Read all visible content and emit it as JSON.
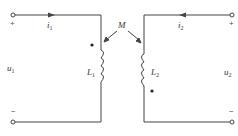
{
  "diagram": {
    "type": "coupled-inductors-circuit",
    "colors": {
      "wire": "#444444",
      "text": "#333333",
      "background": "#ffffff"
    },
    "mutual_inductance": {
      "label": "M"
    },
    "port1": {
      "voltage_label": "u",
      "voltage_sub": "1",
      "current_label": "i",
      "current_sub": "1",
      "plus": "+",
      "minus": "−",
      "current_direction": "right"
    },
    "port2": {
      "voltage_label": "u",
      "voltage_sub": "2",
      "current_label": "i",
      "current_sub": "2",
      "plus": "+",
      "minus": "−",
      "current_direction": "left"
    },
    "inductors": [
      {
        "label": "L",
        "sub": "1",
        "dot": "top-left"
      },
      {
        "label": "L",
        "sub": "2",
        "dot": "bottom-right"
      }
    ]
  }
}
